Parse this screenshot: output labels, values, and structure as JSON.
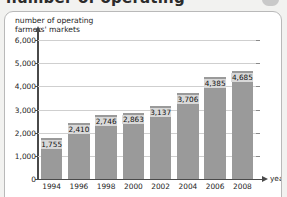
{
  "page": {
    "clipped_heading": "number of operating",
    "badge": "pill-badge"
  },
  "card": {
    "y_axis_title": "number of operating\nfarmers' markets",
    "x_axis_title": "years"
  },
  "chart_data": {
    "type": "bar",
    "title": "number of operating farmers' markets",
    "xlabel": "years",
    "ylabel": "number of operating farmers' markets",
    "categories": [
      "1994",
      "1996",
      "1998",
      "2000",
      "2002",
      "2004",
      "2006",
      "2008"
    ],
    "values": [
      1755,
      2410,
      2746,
      2863,
      3137,
      3706,
      4385,
      4685
    ],
    "value_labels": [
      "1,755",
      "2,410",
      "2,746",
      "2,863",
      "3,137",
      "3,706",
      "4,385",
      "4,685"
    ],
    "ylim": [
      0,
      6000
    ],
    "yticks": [
      0,
      1000,
      2000,
      3000,
      4000,
      5000,
      6000
    ],
    "ytick_labels": [
      "0",
      "1,000",
      "2,000",
      "3,000",
      "4,000",
      "5,000",
      "6,000"
    ],
    "grid": true,
    "legend": null,
    "bar_color": "#9a9a9a",
    "grid_color": "#cfcfcf",
    "axis_color": "#4a4a4a"
  }
}
